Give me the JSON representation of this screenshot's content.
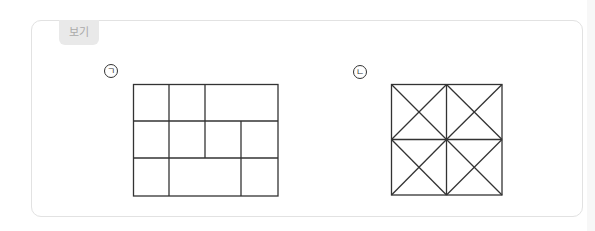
{
  "example_box": {
    "tab_label": "보기"
  },
  "figures": [
    {
      "label": "ㄱ",
      "description": "Rectangle divided into rectangles: 4 columns x 3 rows grid with some merged cells",
      "rows": [
        [
          "1 cell",
          "1 cell",
          "2 cells merged"
        ],
        [
          "1 cell",
          "1 cell",
          "1 cell (spans into row 3? no)",
          "1 cell"
        ],
        [
          "1 cell",
          "2 cells merged",
          "1 cell"
        ]
      ]
    },
    {
      "label": "ㄴ",
      "description": "Square divided into 2x2 squares, each square divided by both diagonals into 4 triangles"
    }
  ],
  "colors": {
    "line": "#333333",
    "box_border": "#e2e2e2",
    "tab_bg": "#e9e9e9",
    "tab_text": "#a9a9a9"
  }
}
